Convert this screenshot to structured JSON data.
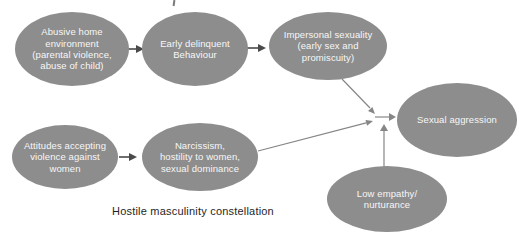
{
  "figure": {
    "caption": "Hostile masculinity constellation",
    "nodes": {
      "abusive_home": {
        "label": "Abusive home\nenvironment\n(parental violence,\nabuse of child)"
      },
      "early_delinquent": {
        "label": "Early delinquent\nBehaviour"
      },
      "impersonal_sexuality": {
        "label": "Impersonal sexuality\n(early sex and\npromiscuity)"
      },
      "sexual_aggression": {
        "label": "Sexual aggression"
      },
      "attitudes_violence": {
        "label": "Attitudes accepting\nviolence against\nwomen"
      },
      "narcissism_hostility": {
        "label": "Narcissism,\nhostility to women,\nsexual dominance"
      },
      "low_empathy": {
        "label": "Low empathy/\nnurturance"
      }
    },
    "edges": [
      {
        "from": "abusive_home",
        "to": "early_delinquent"
      },
      {
        "from": "early_delinquent",
        "to": "impersonal_sexuality"
      },
      {
        "from": "attitudes_violence",
        "to": "narcissism_hostility"
      },
      {
        "from": "impersonal_sexuality",
        "to": "sexual_aggression"
      },
      {
        "from": "narcissism_hostility",
        "to": "sexual_aggression"
      },
      {
        "from": "low_empathy",
        "to": "sexual_aggression"
      }
    ],
    "colors": {
      "node_fill": "#8d8d8d",
      "node_text": "#f7f7f7",
      "connector": "#868686",
      "connector_dark": "#4a4a4a",
      "caption_text": "#1f1f1f",
      "background": "#ffffff"
    }
  }
}
